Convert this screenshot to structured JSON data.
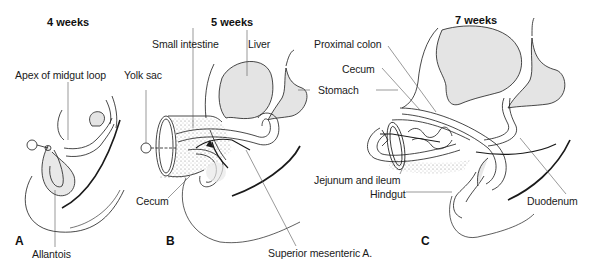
{
  "figure": {
    "panels": [
      {
        "id": "A",
        "title": "4 weeks",
        "labels": [
          "Apex of midgut loop",
          "Yolk sac",
          "Allantois"
        ]
      },
      {
        "id": "B",
        "title": "5 weeks",
        "labels": [
          "Small intestine",
          "Liver",
          "Stomach",
          "Cecum",
          "Superior mesenteric A."
        ]
      },
      {
        "id": "C",
        "title": "7 weeks",
        "labels": [
          "Proximal colon",
          "Cecum",
          "Jejunum and ileum",
          "Hindgut",
          "Duodenum"
        ]
      }
    ],
    "colors": {
      "line": "#1a1a1a",
      "organ_fill": "#e4e4e4",
      "stipple": "#bdbdbd",
      "leader": "#555555"
    }
  }
}
